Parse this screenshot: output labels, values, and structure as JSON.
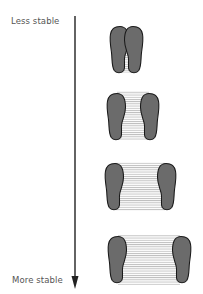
{
  "diagram": {
    "axis": {
      "top_label": "Less stable",
      "bottom_label": "More stable",
      "direction": "down"
    },
    "stances": [
      {
        "name": "feet-together",
        "gap": "narrow",
        "center_y": 50
      },
      {
        "name": "feet-slightly-apart",
        "gap": "small",
        "center_y": 118
      },
      {
        "name": "feet-apart",
        "gap": "medium",
        "center_y": 186
      },
      {
        "name": "feet-wide-apart",
        "gap": "wide",
        "center_y": 258
      }
    ],
    "colors": {
      "foot_fill": "#6b6b6b",
      "foot_stroke": "#1a1a1a",
      "support_hatch": "#999999",
      "arrow": "#222222",
      "label": "#555555"
    }
  }
}
